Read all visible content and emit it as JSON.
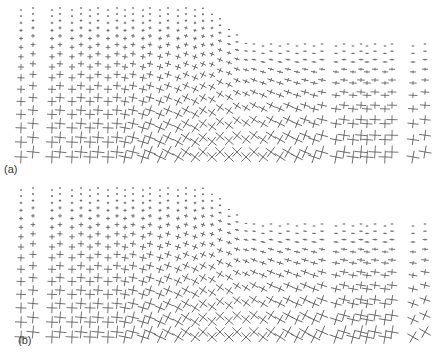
{
  "figure": {
    "panels": [
      {
        "id": "a",
        "label": "(a)",
        "boundary_x_transition": [
          200,
          255
        ],
        "top_left_y": 10,
        "top_right_y": 46,
        "variant": 0
      },
      {
        "id": "b",
        "label": "(b)",
        "boundary_x_transition": [
          200,
          255
        ],
        "top_left_y": 10,
        "top_right_y": 46,
        "variant": 1
      }
    ],
    "columns_x": [
      21,
      33,
      52,
      60,
      72,
      81,
      90,
      98,
      108,
      117,
      125,
      133,
      143,
      150,
      160,
      168,
      178,
      186,
      195,
      203,
      212,
      220,
      229,
      237,
      246,
      254,
      263,
      271,
      280,
      288,
      297,
      305,
      314,
      322,
      336,
      344,
      353,
      361,
      367,
      375,
      385,
      392,
      413,
      425
    ],
    "row_y_start_left": 12,
    "row_y_end": 157,
    "row_count": 15,
    "cross_style": {
      "stroke": "#555555",
      "stroke_width": 0.8,
      "min_arm": 0.8,
      "max_arm": 6.5
    }
  }
}
